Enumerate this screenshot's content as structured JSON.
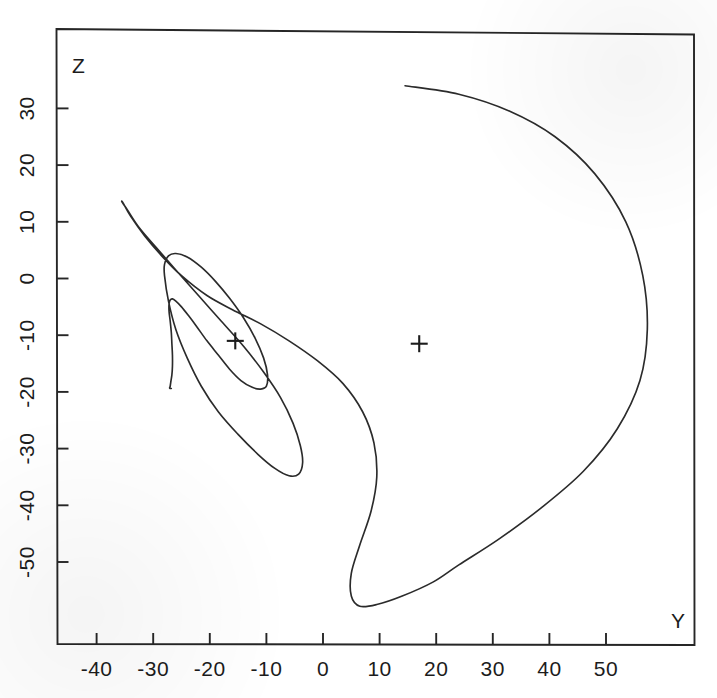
{
  "figure": {
    "kind": "phase-space-trajectory-plot",
    "background_color": "#ffffff",
    "ink_color": "#2b2b2b"
  },
  "axes": {
    "x_axis_name": "Y",
    "y_axis_name": "Z",
    "x_ticks": [
      "-40",
      "-30",
      "-20",
      "-10",
      "0",
      "10",
      "20",
      "30",
      "40",
      "50"
    ],
    "y_ticks": [
      "-50",
      "-40",
      "-30",
      "-20",
      "-10",
      "0",
      "10",
      "20",
      "30"
    ]
  },
  "markers": [
    {
      "name": "fixed-point-left",
      "glyph": "+",
      "y": -15.5,
      "z": -11.0
    },
    {
      "name": "fixed-point-right",
      "glyph": "+",
      "y": 17.0,
      "z": -11.5
    }
  ],
  "chart_data": {
    "type": "line",
    "title": "",
    "xlabel": "Y",
    "ylabel": "Z",
    "xlim": [
      -45.0,
      60.5
    ],
    "ylim": [
      -59.5,
      36.5
    ],
    "grid": false,
    "legend": "none",
    "xticks": [
      -40,
      -30,
      -20,
      -10,
      0,
      10,
      20,
      30,
      40,
      50
    ],
    "yticks": [
      -50,
      -40,
      -30,
      -20,
      -10,
      0,
      10,
      20,
      30
    ],
    "annotations": [
      {
        "text": "+",
        "y": -15.5,
        "z": -11.0,
        "note": "left fixed point marker"
      },
      {
        "text": "+",
        "y": 17.0,
        "z": -11.5,
        "note": "right fixed point marker"
      }
    ],
    "series": [
      {
        "name": "trajectory",
        "description": "inward spiral orbit in the Y-Z plane, traced from the outer large loop through a middle loop and an inner loop into a narrow tail that terminates near Y=-27, Z=-19",
        "x": [
          14.5,
          24.0,
          33.0,
          41.0,
          48.0,
          53.5,
          56.5,
          57.3,
          56.0,
          52.0,
          46.0,
          38.5,
          31.0,
          24.0,
          19.5,
          14.0,
          9.5,
          6.5,
          5.0,
          5.0,
          6.5,
          8.5,
          9.5,
          9.0,
          7.0,
          3.5,
          -1.0,
          -6.0,
          -11.0,
          -16.0,
          -20.5,
          -25.0,
          -28.5,
          -31.5,
          -34.0,
          -35.3,
          -35.5,
          -34.5,
          -32.5,
          -29.5,
          -26.0,
          -22.0,
          -18.0,
          -14.0,
          -10.5,
          -7.5,
          -5.3,
          -4.0,
          -3.6,
          -4.3,
          -6.0,
          -8.5,
          -11.5,
          -15.0,
          -18.5,
          -21.5,
          -24.0,
          -26.0,
          -27.3,
          -28.0,
          -28.0,
          -27.3,
          -26.0,
          -24.0,
          -21.5,
          -19.0,
          -16.5,
          -14.0,
          -12.0,
          -10.5,
          -9.8,
          -10.0,
          -11.0,
          -12.5,
          -14.5,
          -16.5,
          -18.5,
          -20.5,
          -22.3,
          -23.8,
          -25.0,
          -26.0,
          -26.6,
          -27.0,
          -27.2,
          -27.2,
          -27.0,
          -26.8,
          -26.7,
          -26.6,
          -26.6,
          -26.7,
          -26.9,
          -27.0,
          -27.1,
          -27.0,
          -26.9,
          -26.8
        ],
        "y_values": [
          34.0,
          32.5,
          29.5,
          25.0,
          18.5,
          10.0,
          0.5,
          -9.0,
          -18.0,
          -26.5,
          -34.0,
          -40.5,
          -46.0,
          -50.5,
          -53.5,
          -56.0,
          -57.5,
          -57.8,
          -56.0,
          -52.0,
          -47.0,
          -41.0,
          -35.0,
          -29.0,
          -23.5,
          -18.5,
          -14.5,
          -11.0,
          -8.0,
          -5.5,
          -3.0,
          0.5,
          4.0,
          7.5,
          11.0,
          13.3,
          13.5,
          12.0,
          9.0,
          5.5,
          1.5,
          -3.0,
          -7.5,
          -12.0,
          -16.5,
          -21.0,
          -25.5,
          -29.5,
          -32.5,
          -34.5,
          -34.8,
          -33.5,
          -31.0,
          -27.5,
          -23.5,
          -19.0,
          -14.0,
          -9.0,
          -4.0,
          0.5,
          2.5,
          4.0,
          4.4,
          3.8,
          2.0,
          -0.5,
          -3.5,
          -7.0,
          -10.5,
          -14.0,
          -17.0,
          -19.0,
          -19.5,
          -19.2,
          -18.0,
          -16.0,
          -13.5,
          -11.0,
          -8.5,
          -6.5,
          -5.0,
          -4.0,
          -3.6,
          -3.8,
          -4.5,
          -5.8,
          -7.5,
          -9.5,
          -11.5,
          -13.5,
          -15.5,
          -17.0,
          -18.3,
          -19.0,
          -19.3,
          -19.4,
          -19.4,
          -19.4
        ]
      }
    ]
  }
}
